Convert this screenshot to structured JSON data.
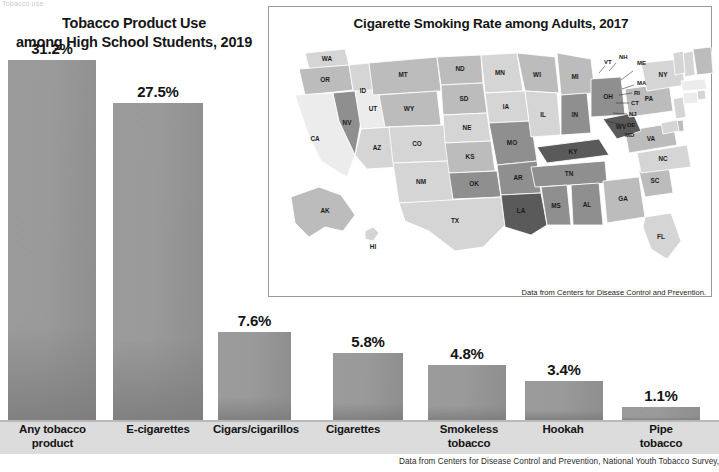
{
  "page": {
    "clipped_header_text": "Tobacco use"
  },
  "bar_chart": {
    "title_line1": "Tobacco Product Use",
    "title_line2": "among High School Students, 2019",
    "source": "Data from Centers for Disease Control and Prevention, National Youth Tobacco Survey, 2019.",
    "bar_color": "#9a9a9a"
  },
  "chart_data": {
    "type": "bar",
    "title": "Tobacco Product Use among High School Students, 2019",
    "xlabel": "",
    "ylabel": "Percent of high school students",
    "ylim": [
      0,
      31.2
    ],
    "grid": false,
    "legend": "none",
    "categories": [
      "Any tobacco product",
      "E-cigarettes",
      "Cigars/cigarillos",
      "Cigarettes",
      "Smokeless tobacco",
      "Hookah",
      "Pipe tobacco"
    ],
    "values": [
      31.2,
      27.5,
      7.6,
      5.8,
      4.8,
      3.4,
      1.1
    ],
    "value_labels": [
      "31.2%",
      "27.5%",
      "7.6%",
      "5.8%",
      "4.8%",
      "3.4%",
      "1.1%"
    ],
    "tick_labels": [
      [
        "Any tobacco",
        "product"
      ],
      [
        "E-cigarettes"
      ],
      [
        "Cigars/cigarillos"
      ],
      [
        "Cigarettes"
      ],
      [
        "Smokeless",
        "tobacco"
      ],
      [
        "Hookah"
      ],
      [
        "Pipe",
        "tobacco"
      ]
    ]
  },
  "map": {
    "title": "Cigarette Smoking Rate among Adults, 2017",
    "source": "Data from Centers for Disease Control and Prevention.",
    "legend": [
      {
        "label": "8.9%–<12.4%",
        "color": "#ececec"
      },
      {
        "label": "12.4%–<15.9%",
        "color": "#d5d5d5"
      },
      {
        "label": "15.9%–<19.4%",
        "color": "#bcbcbc"
      },
      {
        "label": "19.4%–<22.9%",
        "color": "#8f8f8f"
      },
      {
        "label": "22.9%–26.4%",
        "color": "#5a5a5a"
      }
    ],
    "states": [
      {
        "code": "WA",
        "bin": 1
      },
      {
        "code": "OR",
        "bin": 2
      },
      {
        "code": "CA",
        "bin": 0
      },
      {
        "code": "ID",
        "bin": 1
      },
      {
        "code": "NV",
        "bin": 3
      },
      {
        "code": "UT",
        "bin": 0
      },
      {
        "code": "MT",
        "bin": 2
      },
      {
        "code": "WY",
        "bin": 2
      },
      {
        "code": "CO",
        "bin": 1
      },
      {
        "code": "AZ",
        "bin": 1
      },
      {
        "code": "NM",
        "bin": 1
      },
      {
        "code": "ND",
        "bin": 2
      },
      {
        "code": "SD",
        "bin": 2
      },
      {
        "code": "NE",
        "bin": 1
      },
      {
        "code": "KS",
        "bin": 2
      },
      {
        "code": "OK",
        "bin": 3
      },
      {
        "code": "TX",
        "bin": 1
      },
      {
        "code": "MN",
        "bin": 1
      },
      {
        "code": "IA",
        "bin": 1
      },
      {
        "code": "MO",
        "bin": 3
      },
      {
        "code": "AR",
        "bin": 3
      },
      {
        "code": "LA",
        "bin": 4
      },
      {
        "code": "WI",
        "bin": 2
      },
      {
        "code": "IL",
        "bin": 1
      },
      {
        "code": "MI",
        "bin": 2
      },
      {
        "code": "IN",
        "bin": 3
      },
      {
        "code": "OH",
        "bin": 3
      },
      {
        "code": "KY",
        "bin": 4
      },
      {
        "code": "TN",
        "bin": 3
      },
      {
        "code": "MS",
        "bin": 3
      },
      {
        "code": "AL",
        "bin": 3
      },
      {
        "code": "GA",
        "bin": 2
      },
      {
        "code": "FL",
        "bin": 1
      },
      {
        "code": "SC",
        "bin": 2
      },
      {
        "code": "NC",
        "bin": 1
      },
      {
        "code": "VA",
        "bin": 2
      },
      {
        "code": "WV",
        "bin": 4
      },
      {
        "code": "PA",
        "bin": 2
      },
      {
        "code": "NY",
        "bin": 1
      },
      {
        "code": "ME",
        "bin": 2
      },
      {
        "code": "NH",
        "bin": 1
      },
      {
        "code": "VT",
        "bin": 1
      },
      {
        "code": "MA",
        "bin": 0
      },
      {
        "code": "RI",
        "bin": 1
      },
      {
        "code": "CT",
        "bin": 0
      },
      {
        "code": "NJ",
        "bin": 1
      },
      {
        "code": "DE",
        "bin": 2
      },
      {
        "code": "MD",
        "bin": 1
      },
      {
        "code": "AK",
        "bin": 2
      },
      {
        "code": "HI",
        "bin": 1
      }
    ],
    "callout_states": [
      "VT",
      "NH",
      "ME",
      "MA",
      "RI",
      "CT",
      "NJ",
      "DE",
      "MD"
    ]
  }
}
